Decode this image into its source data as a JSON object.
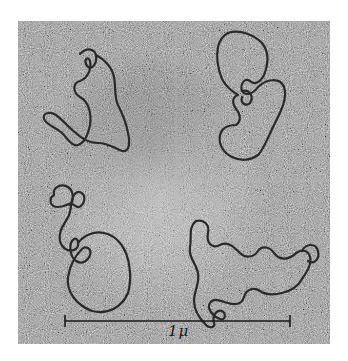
{
  "figure": {
    "type": "electron-micrograph",
    "panels": [
      {
        "position": "top-left",
        "content": "circular DNA molecule"
      },
      {
        "position": "top-right",
        "content": "circular DNA molecule"
      },
      {
        "position": "bottom-left",
        "content": "circular DNA molecule"
      },
      {
        "position": "bottom-right",
        "content": "circular DNA molecule"
      }
    ],
    "scale_bar": {
      "label": "1μ",
      "x_start": 65,
      "x_end": 290,
      "y": 321
    },
    "colors": {
      "background": "#ffffff",
      "grain_base": "#9a9a9a",
      "strand": "#2a2a2a"
    }
  }
}
